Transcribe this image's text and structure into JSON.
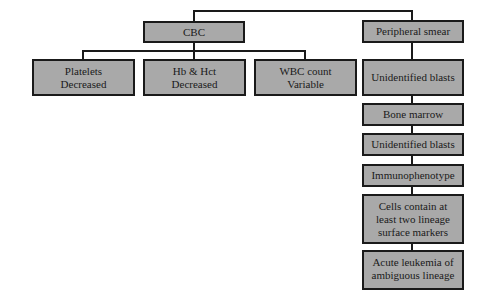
{
  "diagram": {
    "cbc": "CBC",
    "peripheral_smear": "Peripheral smear",
    "cbc_children": [
      {
        "line1": "Platelets",
        "line2": "Decreased"
      },
      {
        "line1": "Hb & Hct",
        "line2": "Decreased"
      },
      {
        "line1": "WBC count",
        "line2": "Variable"
      }
    ],
    "smear_chain": [
      "Unidentified blasts",
      "Bone marrow",
      "Unidentified blasts",
      "Immunophenotype",
      {
        "line1": "Cells contain at",
        "line2": "least two lineage",
        "line3": "surface markers"
      },
      {
        "line1": "Acute leukemia of",
        "line2": "ambiguous lineage"
      }
    ]
  }
}
